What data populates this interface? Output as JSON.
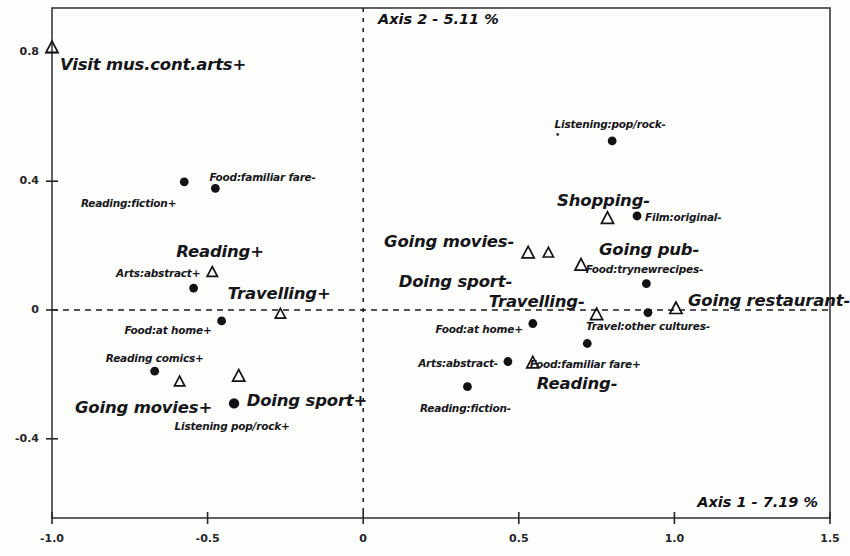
{
  "chart_data": {
    "type": "scatter",
    "title": "",
    "xlabel": "Axis 1 - 7.19 %",
    "ylabel": "Axis 2 - 5.11 %",
    "xlim": [
      -1.0,
      1.5
    ],
    "ylim": [
      -0.58,
      0.94
    ],
    "xticks": [
      "-1.0",
      "-0.5",
      "0",
      "0.5",
      "1.0",
      "1.5"
    ],
    "xtick_values": [
      -1.0,
      -0.5,
      0,
      0.5,
      1.0,
      1.5
    ],
    "yticks": [
      "0.8",
      "0.4",
      "0",
      "-0.4"
    ],
    "ytick_values": [
      0.8,
      0.4,
      0,
      -0.4
    ],
    "grid": false,
    "reference_lines": [
      {
        "name": "horizontal-zero-line",
        "axis": "y",
        "value": 0,
        "style": "dashed"
      },
      {
        "name": "vertical-zero-line",
        "axis": "x",
        "value": 0,
        "style": "dashed"
      }
    ],
    "legend": "none",
    "marker_types": {
      "triangle": "open triangle (supplementary/illustrative category)",
      "circle": "filled circle (active category)"
    },
    "points": [
      {
        "label": "Visit mus.cont.arts+",
        "x": -1.0,
        "y": 0.815,
        "marker": "triangle",
        "size": "large",
        "label_dx": 8,
        "label_dy": 18,
        "label_anchor": "start"
      },
      {
        "label": "Reading:fiction+",
        "x": -0.575,
        "y": 0.398,
        "marker": "circle",
        "size": "small",
        "label_dx": -8,
        "label_dy": 22,
        "label_anchor": "end"
      },
      {
        "label": "Food:familiar fare-",
        "x": -0.475,
        "y": 0.378,
        "marker": "circle",
        "size": "small",
        "label_dx": -6,
        "label_dy": -10,
        "label_anchor": "start"
      },
      {
        "label": "Reading+",
        "x": -0.46,
        "y": 0.178,
        "marker": "none",
        "size": "large",
        "label_dx": 0,
        "label_dy": 0,
        "label_anchor": "mid"
      },
      {
        "label": "Arts:abstract+",
        "x": -0.485,
        "y": 0.118,
        "marker": "triangle",
        "size": "small",
        "label_dx": -12,
        "label_dy": 2,
        "label_anchor": "end"
      },
      {
        "label": "Travelling+",
        "x": -0.27,
        "y": 0.048,
        "marker": "none",
        "size": "large",
        "label_dx": 0,
        "label_dy": 0,
        "label_anchor": "mid"
      },
      {
        "label": "",
        "x": -0.545,
        "y": 0.068,
        "marker": "circle",
        "size": "small",
        "label_dx": 0,
        "label_dy": 0,
        "label_anchor": "mid"
      },
      {
        "label": "",
        "x": -0.266,
        "y": -0.012,
        "marker": "triangle",
        "size": "small",
        "label_dx": 0,
        "label_dy": 0,
        "label_anchor": "mid"
      },
      {
        "label": "Food:at home+",
        "x": -0.455,
        "y": -0.034,
        "marker": "circle",
        "size": "small",
        "label_dx": -10,
        "label_dy": 10,
        "label_anchor": "end"
      },
      {
        "label": "Reading comics+",
        "x": -0.67,
        "y": -0.19,
        "marker": "circle",
        "size": "small",
        "label_dx": 0,
        "label_dy": -12,
        "label_anchor": "mid"
      },
      {
        "label": "Doing sport+",
        "x": -0.4,
        "y": -0.205,
        "marker": "triangle",
        "size": "large",
        "label_dx": 8,
        "label_dy": 26,
        "label_anchor": "start"
      },
      {
        "label": "",
        "x": -0.59,
        "y": -0.222,
        "marker": "triangle",
        "size": "small",
        "label_dx": 0,
        "label_dy": 0,
        "label_anchor": "mid"
      },
      {
        "label": "Going movies+",
        "x": -0.415,
        "y": -0.29,
        "marker": "circle",
        "size": "large",
        "label_dx": -22,
        "label_dy": 6,
        "label_anchor": "end"
      },
      {
        "label": "Listening pop/rock+",
        "x": -0.415,
        "y": -0.29,
        "marker": "none",
        "size": "small",
        "label_dx": -2,
        "label_dy": 24,
        "label_anchor": "mid"
      },
      {
        "label": "Listening:pop/rock-",
        "x": 0.8,
        "y": 0.525,
        "marker": "circle",
        "size": "small",
        "label_dx": -2,
        "label_dy": -16,
        "label_anchor": "mid"
      },
      {
        "label": "Shopping-",
        "x": 0.785,
        "y": 0.285,
        "marker": "triangle",
        "size": "large",
        "label_dx": -4,
        "label_dy": -16,
        "label_anchor": "mid"
      },
      {
        "label": "Film:original-",
        "x": 0.88,
        "y": 0.292,
        "marker": "circle",
        "size": "small",
        "label_dx": 8,
        "label_dy": 2,
        "label_anchor": "start"
      },
      {
        "label": "Going movies-",
        "x": 0.53,
        "y": 0.178,
        "marker": "triangle",
        "size": "large",
        "label_dx": -14,
        "label_dy": -10,
        "label_anchor": "end"
      },
      {
        "label": "",
        "x": 0.595,
        "y": 0.178,
        "marker": "triangle",
        "size": "small",
        "label_dx": 0,
        "label_dy": 0,
        "label_anchor": "mid"
      },
      {
        "label": "Going pub-",
        "x": 0.7,
        "y": 0.14,
        "marker": "triangle",
        "size": "large",
        "label_dx": 18,
        "label_dy": -14,
        "label_anchor": "start"
      },
      {
        "label": "Doing sport-",
        "x": 0.53,
        "y": 0.178,
        "marker": "none",
        "size": "large",
        "label_dx": -16,
        "label_dy": 30,
        "label_anchor": "end"
      },
      {
        "label": "Food:trynewrecipes-",
        "x": 0.91,
        "y": 0.082,
        "marker": "circle",
        "size": "small",
        "label_dx": -2,
        "label_dy": -14,
        "label_anchor": "mid"
      },
      {
        "label": "Travelling-",
        "x": 0.75,
        "y": -0.014,
        "marker": "triangle",
        "size": "large",
        "label_dx": -12,
        "label_dy": -12,
        "label_anchor": "end"
      },
      {
        "label": "Going restaurant-",
        "x": 1.005,
        "y": 0.005,
        "marker": "triangle",
        "size": "large",
        "label_dx": 12,
        "label_dy": -6,
        "label_anchor": "start"
      },
      {
        "label": "Travel:other cultures-",
        "x": 0.915,
        "y": -0.008,
        "marker": "circle",
        "size": "small",
        "label_dx": 0,
        "label_dy": 14,
        "label_anchor": "mid"
      },
      {
        "label": "Food:at home+",
        "x": 0.545,
        "y": -0.042,
        "marker": "circle",
        "size": "small",
        "label_dx": -10,
        "label_dy": 6,
        "label_anchor": "end"
      },
      {
        "label": "Food:familiar fare+",
        "x": 0.72,
        "y": -0.104,
        "marker": "circle",
        "size": "small",
        "label_dx": -2,
        "label_dy": 22,
        "label_anchor": "mid"
      },
      {
        "label": "Arts:abstract-",
        "x": 0.465,
        "y": -0.16,
        "marker": "circle",
        "size": "small",
        "label_dx": -10,
        "label_dy": 2,
        "label_anchor": "end"
      },
      {
        "label": "Reading-",
        "x": 0.545,
        "y": -0.164,
        "marker": "triangle",
        "size": "large",
        "label_dx": 4,
        "label_dy": 22,
        "label_anchor": "start"
      },
      {
        "label": "Reading:fiction-",
        "x": 0.335,
        "y": -0.238,
        "marker": "circle",
        "size": "small",
        "label_dx": -2,
        "label_dy": 22,
        "label_anchor": "mid"
      },
      {
        "label": "",
        "x": 0.625,
        "y": 0.545,
        "marker": "speck",
        "size": "small",
        "label_dx": 0,
        "label_dy": 0,
        "label_anchor": "mid"
      }
    ]
  },
  "plot": {
    "frame_color": "#3b3b3f",
    "marker_color": "#121216",
    "axis1_title": "Axis 1  -  7.19 %",
    "axis2_title": "Axis 2  -  5.11 %"
  }
}
